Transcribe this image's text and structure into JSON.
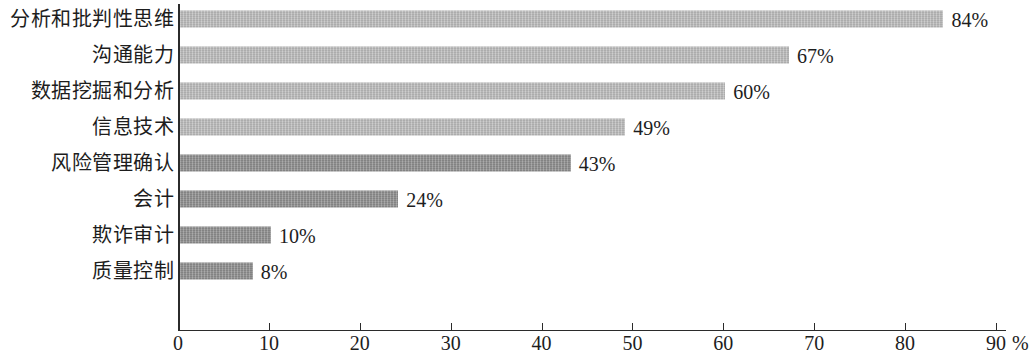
{
  "chart_data": {
    "type": "bar",
    "orientation": "horizontal",
    "title": "",
    "xlabel": "",
    "ylabel": "",
    "xlim": [
      0,
      90
    ],
    "xticks": [
      0,
      10,
      20,
      30,
      40,
      50,
      60,
      70,
      80,
      90
    ],
    "xtick_labels": [
      "0",
      "10",
      "20",
      "30",
      "40",
      "50",
      "60",
      "70",
      "80",
      "90"
    ],
    "x_unit": "%",
    "grid": false,
    "legend": false,
    "categories": [
      "分析和批判性思维",
      "沟通能力",
      "数据挖掘和分析",
      "信息技术",
      "风险管理确认",
      "会计",
      "欺诈审计",
      "质量控制"
    ],
    "values": [
      84,
      67,
      60,
      49,
      43,
      24,
      10,
      8
    ],
    "value_labels": [
      "84%",
      "67%",
      "60%",
      "49%",
      "43%",
      "24%",
      "10%",
      "8%"
    ],
    "bar_colors": [
      "#bcbcbc",
      "#bcbcbc",
      "#bcbcbc",
      "#bcbcbc",
      "#8f8f8f",
      "#8f8f8f",
      "#8f8f8f",
      "#8f8f8f"
    ]
  },
  "axis": {
    "line_color": "#2b2b2b"
  }
}
